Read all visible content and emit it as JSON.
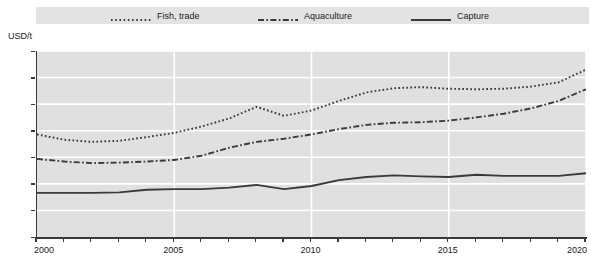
{
  "legend": {
    "items": [
      {
        "label": "Fish, trade",
        "style": "dotted",
        "color": "#3a3a3a",
        "name": "legend-item-fish-trade"
      },
      {
        "label": "Aquaculture",
        "style": "dashdot",
        "color": "#3a3a3a",
        "name": "legend-item-aquaculture"
      },
      {
        "label": "Capture",
        "style": "solid",
        "color": "#3a3a3a",
        "name": "legend-item-capture"
      }
    ]
  },
  "axis": {
    "y_unit_label": "USD/t",
    "y_ticks": [
      "0",
      "500",
      "1000",
      "1500",
      "2000",
      "2500",
      "3000",
      "3500"
    ],
    "x_ticks": [
      "2000",
      "2005",
      "2010",
      "2015",
      "2020"
    ]
  },
  "colors": {
    "plot_background": "#e0e0e0",
    "legend_background": "#e3e3e3",
    "gridline": "#ffffff",
    "axis": "#3a3a3a",
    "series": "#3a3a3a"
  },
  "chart_data": {
    "type": "line",
    "title": "",
    "subtitle": "",
    "xlabel": "",
    "ylabel": "USD/t",
    "ylim": [
      0,
      3500
    ],
    "xlim": [
      2000,
      2020
    ],
    "yticks": [
      0,
      500,
      1000,
      1500,
      2000,
      2500,
      3000,
      3500
    ],
    "xticks": [
      2000,
      2005,
      2010,
      2015,
      2020
    ],
    "xtick_minor_step": 1,
    "grid": true,
    "grid_color": "#ffffff",
    "legend_position": "top",
    "x": [
      2000,
      2001,
      2002,
      2003,
      2004,
      2005,
      2006,
      2007,
      2008,
      2009,
      2010,
      2011,
      2012,
      2013,
      2014,
      2015,
      2016,
      2017,
      2018,
      2019,
      2020
    ],
    "series": [
      {
        "name": "Fish, trade",
        "linestyle": "dotted",
        "color": "#3a3a3a",
        "values": [
          1930,
          1830,
          1790,
          1810,
          1880,
          1960,
          2080,
          2230,
          2450,
          2280,
          2380,
          2560,
          2720,
          2800,
          2820,
          2790,
          2780,
          2790,
          2830,
          2910,
          3150
        ]
      },
      {
        "name": "Aquaculture",
        "linestyle": "dashdot",
        "color": "#3a3a3a",
        "values": [
          1470,
          1420,
          1390,
          1400,
          1420,
          1450,
          1530,
          1680,
          1790,
          1850,
          1930,
          2030,
          2110,
          2150,
          2160,
          2190,
          2250,
          2320,
          2420,
          2560,
          2780
        ]
      },
      {
        "name": "Capture",
        "linestyle": "solid",
        "color": "#3a3a3a",
        "values": [
          830,
          830,
          830,
          840,
          890,
          900,
          900,
          930,
          980,
          900,
          960,
          1070,
          1130,
          1160,
          1140,
          1130,
          1170,
          1150,
          1150,
          1150,
          1200
        ]
      }
    ]
  }
}
